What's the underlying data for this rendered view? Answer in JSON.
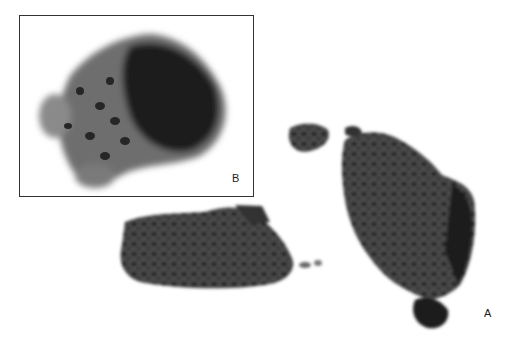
{
  "figure": {
    "panels": [
      {
        "id": "A",
        "label": "A",
        "description": "Two tissue fragments of densely packed cells, low magnification"
      },
      {
        "id": "B",
        "label": "B",
        "description": "Inset: cell cluster at higher magnification"
      }
    ],
    "colors": {
      "background": "#ffffff",
      "tissue_dark": "#1e1e1e",
      "tissue_mid": "#555555",
      "tissue_light": "#8a8a8a",
      "border": "#333333"
    }
  }
}
